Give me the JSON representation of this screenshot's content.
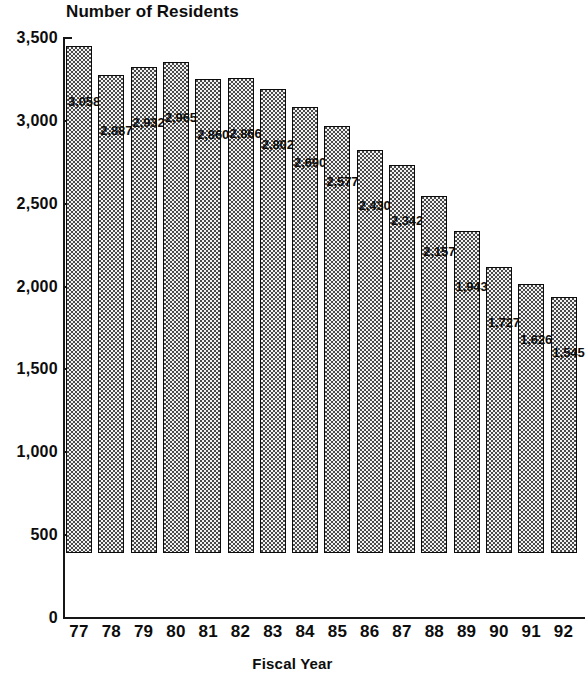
{
  "chart_data": {
    "type": "bar",
    "title": "Number of Residents",
    "xlabel": "Fiscal Year",
    "ylabel": "",
    "categories": [
      "77",
      "78",
      "79",
      "80",
      "81",
      "82",
      "83",
      "84",
      "85",
      "86",
      "87",
      "88",
      "89",
      "90",
      "91",
      "92"
    ],
    "values": [
      3058,
      2887,
      2932,
      2965,
      2860,
      2866,
      2802,
      2690,
      2577,
      2430,
      2342,
      2157,
      1943,
      1727,
      1626,
      1545
    ],
    "value_labels": [
      "3,058",
      "2,887",
      "2,932",
      "2,965",
      "2,860",
      "2,866",
      "2,802",
      "2,690",
      "2,577",
      "2,430",
      "2,342",
      "2,157",
      "1,943",
      "1,727",
      "1,626",
      "1,545"
    ],
    "ylim": [
      0,
      3500
    ],
    "y_ticks": [
      0,
      500,
      1000,
      1500,
      2000,
      2500,
      3000,
      3500
    ],
    "y_tick_labels": [
      "0",
      "500",
      "1,000",
      "1,500",
      "2,000",
      "2,500",
      "3,000",
      "3,500"
    ],
    "grid": false,
    "legend": null,
    "series_name": "Number of Residents",
    "bar_fill": "checkerboard-pattern",
    "colors": {
      "axis": "#161616",
      "text": "#0d0d0d",
      "bar_fill_dark": "#4a4a4a",
      "bar_fill_light": "#f2f2f2",
      "bar_outline": "#0b0b0b",
      "background": "#ffffff"
    }
  }
}
